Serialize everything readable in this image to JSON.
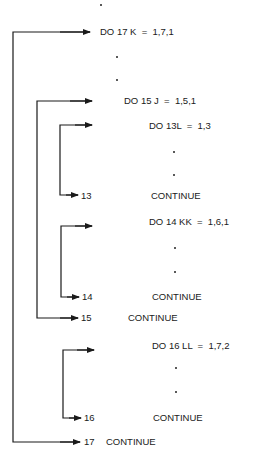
{
  "diagram": {
    "statements": [
      {
        "id": "do17",
        "text": "DO 17 K  =  1,7,1"
      },
      {
        "id": "do15",
        "text": "DO 15 J  =  1,5,1"
      },
      {
        "id": "do13",
        "text": "DO 13L  =  1,3"
      },
      {
        "id": "cont13",
        "label": "13",
        "text": "CONTINUE"
      },
      {
        "id": "do14",
        "text": "DO 14 KK  =  1,6,1"
      },
      {
        "id": "cont14",
        "label": "14",
        "text": "CONTINUE"
      },
      {
        "id": "cont15",
        "label": "15",
        "text": "CONTINUE"
      },
      {
        "id": "do16",
        "text": "DO 16 LL  =  1,7,2"
      },
      {
        "id": "cont16",
        "label": "16",
        "text": "CONTINUE"
      },
      {
        "id": "cont17",
        "label": "17",
        "text": "CONTINUE"
      }
    ],
    "loops": [
      {
        "var": "K",
        "range": "1,7,1",
        "end_label": "17"
      },
      {
        "var": "J",
        "range": "1,5,1",
        "end_label": "15"
      },
      {
        "var": "L",
        "range": "1,3",
        "end_label": "13"
      },
      {
        "var": "KK",
        "range": "1,6,1",
        "end_label": "14"
      },
      {
        "var": "LL",
        "range": "1,7,2",
        "end_label": "16"
      }
    ],
    "ellipsis": "·",
    "colors": {
      "line": "#1a1a1a",
      "background": "#ffffff"
    }
  }
}
